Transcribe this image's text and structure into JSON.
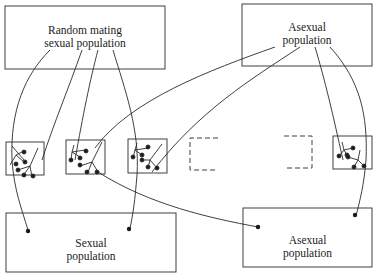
{
  "diagram": {
    "stroke_color": "#2a2a2a",
    "background": "#ffffff",
    "boxes": {
      "random_mating": {
        "label_line1": "Random mating",
        "label_line2": "sexual population"
      },
      "asexual_top": {
        "label_line1": "Asexual",
        "label_line2": "population"
      },
      "sexual_bottom": {
        "label_line1": "Sexual",
        "label_line2": "population"
      },
      "asexual_bottom": {
        "label_line1": "Asexual",
        "label_line2": "population"
      }
    },
    "lineage_boxes": [
      {
        "name": "lineage-1",
        "style": "solid"
      },
      {
        "name": "lineage-2",
        "style": "solid"
      },
      {
        "name": "lineage-3",
        "style": "solid"
      },
      {
        "name": "lineage-4",
        "style": "dashed"
      },
      {
        "name": "lineage-5",
        "style": "dashed"
      },
      {
        "name": "lineage-6",
        "style": "solid"
      }
    ]
  }
}
